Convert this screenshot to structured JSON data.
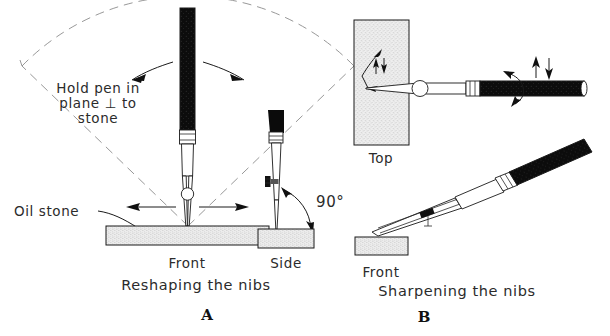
{
  "figure": {
    "background_color": "#ffffff",
    "ink_color": "#1a1a1a",
    "construction_line_color": "#8c8c8c",
    "stone_fill_color": "#e8e8e8"
  },
  "panel_a": {
    "letter": "A",
    "caption": "Reshaping the nibs",
    "note_line1": "Hold pen in",
    "note_line2": "plane ⊥ to",
    "note_line3": "stone",
    "stone_label": "Oil stone",
    "view_front": "Front",
    "view_side": "Side",
    "angle_label": "90°"
  },
  "panel_b": {
    "letter": "B",
    "caption": "Sharpening the nibs",
    "view_top": "Top",
    "view_front": "Front"
  },
  "icons": {
    "swing_arrow_left": "curved-arrow-left-icon",
    "swing_arrow_right": "curved-arrow-right-icon",
    "spread_arrow_left": "arrow-left-icon",
    "spread_arrow_right": "arrow-right-icon",
    "angle_arc": "angle-arc-icon",
    "stroke_arrows": "up-down-arrow-icon",
    "rotate_arrow": "rotate-arrow-icon",
    "leader_arrow": "leader-arrow-icon"
  }
}
